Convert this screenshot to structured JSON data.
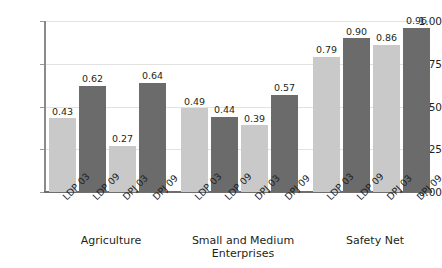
{
  "chart_data": {
    "type": "bar",
    "title": "",
    "subtitle": "",
    "xlabel": "",
    "ylabel": "",
    "ylim": [
      0.0,
      1.0
    ],
    "yticks": [
      "0.00",
      "0.25",
      "0.50",
      "0.75",
      "1.00"
    ],
    "ytick_values": [
      0.0,
      0.25,
      0.5,
      0.75,
      1.0
    ],
    "grid": true,
    "legend": "none",
    "categories": [
      "LDP 03",
      "LDP 09",
      "DPJ 03",
      "DPJ 09"
    ],
    "groups": [
      {
        "name": "Agriculture",
        "bars": [
          {
            "label": "LDP 03",
            "value": 0.43,
            "value_text": "0.43",
            "color": "#c9c9c9"
          },
          {
            "label": "LDP 09",
            "value": 0.62,
            "value_text": "0.62",
            "color": "#6b6b6b"
          },
          {
            "label": "DPJ 03",
            "value": 0.27,
            "value_text": "0.27",
            "color": "#c9c9c9"
          },
          {
            "label": "DPJ 09",
            "value": 0.64,
            "value_text": "0.64",
            "color": "#6b6b6b"
          }
        ]
      },
      {
        "name": "Small and Medium\nEnterprises",
        "bars": [
          {
            "label": "LDP 03",
            "value": 0.49,
            "value_text": "0.49",
            "color": "#c9c9c9"
          },
          {
            "label": "LDP 09",
            "value": 0.44,
            "value_text": "0.44",
            "color": "#6b6b6b"
          },
          {
            "label": "DPJ 03",
            "value": 0.39,
            "value_text": "0.39",
            "color": "#c9c9c9"
          },
          {
            "label": "DPJ 09",
            "value": 0.57,
            "value_text": "0.57",
            "color": "#6b6b6b"
          }
        ]
      },
      {
        "name": "Safety Net",
        "bars": [
          {
            "label": "LDP 03",
            "value": 0.79,
            "value_text": "0.79",
            "color": "#c9c9c9"
          },
          {
            "label": "LDP 09",
            "value": 0.9,
            "value_text": "0.90",
            "color": "#6b6b6b"
          },
          {
            "label": "DPJ 03",
            "value": 0.86,
            "value_text": "0.86",
            "color": "#c9c9c9"
          },
          {
            "label": "DPJ 09",
            "value": 0.96,
            "value_text": "0.96",
            "color": "#6b6b6b"
          }
        ]
      }
    ],
    "colors": {
      "bar_light": "#c9c9c9",
      "bar_dark": "#6b6b6b",
      "gridline": "#e2e2e2",
      "axis": "#8a8a8a",
      "text": "#231f20",
      "background": "#ffffff"
    }
  }
}
